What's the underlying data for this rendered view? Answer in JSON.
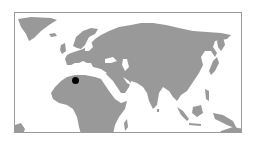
{
  "map": {
    "region": "Eurasia and Africa",
    "land_color": "#999999",
    "water_color": "#ffffff",
    "border_color": "#9a9a9a",
    "markers": [
      {
        "label": "location-marker",
        "x": 74,
        "y": 79,
        "color": "#000000",
        "approx_location": "North Africa (Algeria/Tunisia)"
      }
    ]
  }
}
